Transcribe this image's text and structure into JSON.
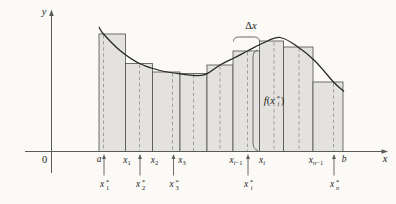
{
  "figure": {
    "canvas": {
      "width": 396,
      "height": 204,
      "background": "#fbfaf7"
    },
    "style": {
      "rect_fill": "#e3e2de",
      "rect_stroke": "#4f4f4f",
      "dash_stroke": "#8f8f8f",
      "curve_stroke": "#262626",
      "axis_stroke": "#5a5a5a",
      "text_color": "#262626"
    },
    "axes": {
      "y_axis": {
        "x": 51.5,
        "y_top": 13,
        "y_bottom": 173,
        "arrow_tip_y": 9.5,
        "label": "y"
      },
      "x_axis": {
        "y": 151.5,
        "x_left": 25,
        "x_right": 382,
        "arrow_tip_x": 388,
        "label": "x"
      },
      "origin_label": "0"
    },
    "rects": {
      "boundaries": [
        99,
        125.5,
        152.5,
        180,
        207,
        233,
        259.5,
        283.5,
        313,
        343
      ],
      "tops": [
        34,
        63.5,
        72,
        73.5,
        65,
        51,
        41,
        47,
        82
      ],
      "bottom": 151.5
    },
    "sample_lines": {
      "xs": [
        103.5,
        139.5,
        172.5,
        193.5,
        220,
        247.5,
        274,
        299,
        333.5
      ]
    },
    "x_tick_labels": [
      {
        "x": 99,
        "y": 160,
        "base": "a",
        "sub": ""
      },
      {
        "x": 127,
        "y": 161,
        "base": "x",
        "sub": "1"
      },
      {
        "x": 154.5,
        "y": 161,
        "base": "x",
        "sub": "2"
      },
      {
        "x": 182,
        "y": 161,
        "base": "x",
        "sub": "3"
      },
      {
        "x": 236,
        "y": 161,
        "base": "x",
        "sub": "i−1"
      },
      {
        "x": 262,
        "y": 161,
        "base": "x",
        "sub": "i"
      },
      {
        "x": 316,
        "y": 161,
        "base": "x",
        "sub": "n−1"
      },
      {
        "x": 344,
        "y": 160,
        "base": "b",
        "sub": ""
      }
    ],
    "starred_samples": [
      {
        "x": 104,
        "base": "x",
        "sub": "1",
        "sup": "*"
      },
      {
        "x": 140,
        "base": "x",
        "sub": "2",
        "sup": "*"
      },
      {
        "x": 173.5,
        "base": "x",
        "sub": "3",
        "sup": "*"
      },
      {
        "x": 248,
        "base": "x",
        "sub": "i",
        "sup": "*"
      },
      {
        "x": 334,
        "base": "x",
        "sub": "n",
        "sup": "*"
      }
    ],
    "starred_label_y": 185,
    "annotations": {
      "delta_x": {
        "delta": "Δ",
        "variable": "x",
        "label_x": 251,
        "label_y": 26,
        "brace_x1": 233.5,
        "brace_x2": 259.5,
        "brace_y": 41.5
      },
      "fx": {
        "func": "f",
        "open": "(",
        "base": "x",
        "sub": "i",
        "sup": "*",
        "close": ")",
        "label_x": 274,
        "label_y": 101.5,
        "brace_x": 253,
        "brace_top": 50,
        "brace_bottom": 150.5
      }
    },
    "curve_points": [
      [
        99,
        27
      ],
      [
        103.5,
        34
      ],
      [
        120,
        50.5
      ],
      [
        139.5,
        63.5
      ],
      [
        160,
        70.5
      ],
      [
        180,
        73.8
      ],
      [
        203,
        75.2
      ],
      [
        220,
        65
      ],
      [
        234,
        58
      ],
      [
        247.5,
        51
      ],
      [
        262,
        43.5
      ],
      [
        280,
        37.5
      ],
      [
        298,
        47
      ],
      [
        315,
        61
      ],
      [
        333.5,
        82
      ],
      [
        344,
        91.5
      ]
    ]
  }
}
